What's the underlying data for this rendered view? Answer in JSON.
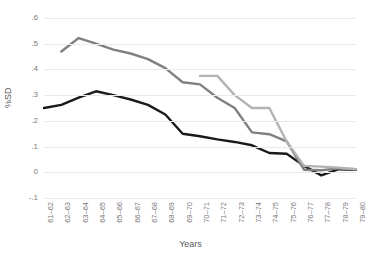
{
  "chart_data": {
    "type": "line",
    "title": "",
    "xlabel": "Years",
    "ylabel": "%SD",
    "grid": "horizontal",
    "legend": "none",
    "ylim": [
      -0.1,
      0.6
    ],
    "yticks": [
      0.6,
      0.5,
      0.4,
      0.3,
      0.2,
      0.1,
      0.0,
      -0.1
    ],
    "ytick_labels": [
      ".6",
      ".5",
      ".4",
      ".3",
      ".2",
      ".1",
      "0",
      "-.1"
    ],
    "categories": [
      "61–62",
      "62–63",
      "63–64",
      "64–65",
      "65–66",
      "66–67",
      "67–68",
      "68–69",
      "69–70",
      "70–71",
      "71–72",
      "72–73",
      "73–74",
      "74–75",
      "75–76",
      "76–77",
      "77–78",
      "78–79",
      "79–80"
    ],
    "series": [
      {
        "name": "series-black",
        "color": "#1a1a1a",
        "width": 2.4,
        "values": [
          0.25,
          0.262,
          0.29,
          0.315,
          0.3,
          0.283,
          0.262,
          0.225,
          0.15,
          0.14,
          0.128,
          0.118,
          0.105,
          0.075,
          0.072,
          0.025,
          -0.012,
          0.012,
          0.01
        ]
      },
      {
        "name": "series-dark-gray",
        "color": "#808080",
        "width": 2.4,
        "values": [
          null,
          0.47,
          0.522,
          0.5,
          0.477,
          0.462,
          0.44,
          0.405,
          0.35,
          0.342,
          0.29,
          0.25,
          0.155,
          0.148,
          0.12,
          0.01,
          0.008,
          0.015,
          0.012
        ]
      },
      {
        "name": "series-light-gray",
        "color": "#b3b3b3",
        "width": 2.4,
        "values": [
          null,
          null,
          null,
          null,
          null,
          null,
          null,
          null,
          null,
          0.375,
          0.375,
          0.3,
          0.25,
          0.25,
          0.12,
          0.025,
          0.022,
          0.018,
          0.012
        ]
      }
    ]
  },
  "axes": {
    "y_title": "%SD",
    "x_title": "Years"
  }
}
